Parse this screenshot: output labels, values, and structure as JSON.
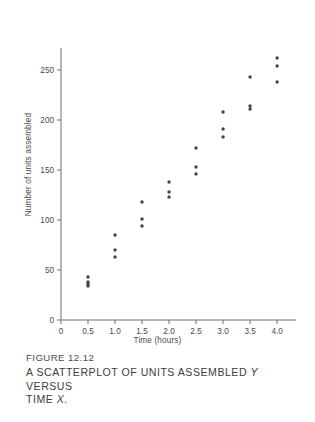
{
  "figure": {
    "number_label": "FIGURE 12.12",
    "title_line1_pre": "A SCATTERPLOT OF UNITS ASSEMBLED ",
    "title_line1_var": "Y",
    "title_line1_post": " VERSUS",
    "title_line2_pre": "TIME ",
    "title_line2_var": "X",
    "title_line2_post": ".",
    "title_plain": "A SCATTERPLOT OF UNITS ASSEMBLED Y VERSUS TIME X."
  },
  "chart_data": {
    "type": "scatter",
    "title": "",
    "xlabel": "Time (hours)",
    "ylabel": "Number of units assembled",
    "xlim": [
      0,
      4.35
    ],
    "ylim": [
      0,
      272
    ],
    "xticks": [
      0,
      0.5,
      1.0,
      1.5,
      2.0,
      2.5,
      3.0,
      3.5,
      4.0
    ],
    "xticklabels": [
      "0",
      "0.5",
      "1.0",
      "1.5",
      "2.0",
      "2.5",
      "3.0",
      "3.5",
      "4.0"
    ],
    "yticks": [
      0,
      50,
      100,
      150,
      200,
      250
    ],
    "yticklabels": [
      "0",
      "50",
      "100",
      "150",
      "200",
      "250"
    ],
    "grid": false,
    "legend": null,
    "marker": {
      "shape": "circle",
      "color": "#444444",
      "size_px": 3.4
    },
    "axis_color": "#6e6e6e",
    "points": [
      {
        "x": 0.5,
        "y": 43
      },
      {
        "x": 0.5,
        "y": 38
      },
      {
        "x": 0.5,
        "y": 36
      },
      {
        "x": 0.5,
        "y": 34
      },
      {
        "x": 1.0,
        "y": 85
      },
      {
        "x": 1.0,
        "y": 70
      },
      {
        "x": 1.0,
        "y": 63
      },
      {
        "x": 1.5,
        "y": 118
      },
      {
        "x": 1.5,
        "y": 101
      },
      {
        "x": 1.5,
        "y": 94
      },
      {
        "x": 2.0,
        "y": 138
      },
      {
        "x": 2.0,
        "y": 128
      },
      {
        "x": 2.0,
        "y": 123
      },
      {
        "x": 2.5,
        "y": 172
      },
      {
        "x": 2.5,
        "y": 153
      },
      {
        "x": 2.5,
        "y": 146
      },
      {
        "x": 3.0,
        "y": 208
      },
      {
        "x": 3.0,
        "y": 191
      },
      {
        "x": 3.0,
        "y": 183
      },
      {
        "x": 3.5,
        "y": 243
      },
      {
        "x": 3.5,
        "y": 214
      },
      {
        "x": 3.5,
        "y": 211
      },
      {
        "x": 4.0,
        "y": 262
      },
      {
        "x": 4.0,
        "y": 254
      },
      {
        "x": 4.0,
        "y": 238
      }
    ]
  }
}
